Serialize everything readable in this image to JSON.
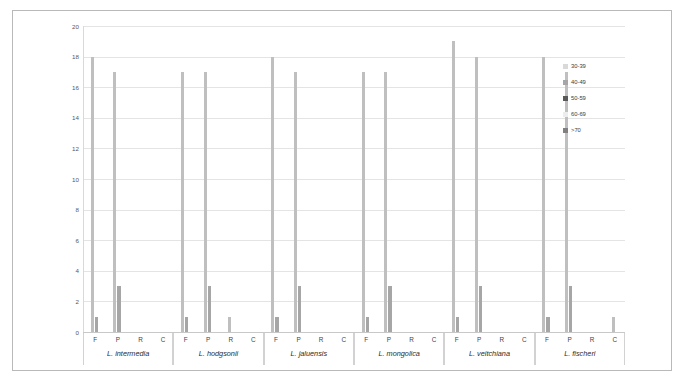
{
  "chart_data": {
    "type": "bar",
    "title": "",
    "xlabel": "",
    "ylabel": "",
    "ylim": [
      0,
      20
    ],
    "ytick_labels": [
      "0",
      "2",
      "4",
      "6",
      "8",
      "10",
      "12",
      "14",
      "16",
      "18",
      "20"
    ],
    "ytick_values": [
      0,
      2,
      4,
      6,
      8,
      10,
      12,
      14,
      16,
      18,
      20
    ],
    "grid": true,
    "legend_position": "right",
    "categories": [
      "F",
      "P",
      "R",
      "C"
    ],
    "groups": [
      {
        "species": "L. intermedia",
        "categories": [
          "F",
          "P",
          "R",
          "C"
        ],
        "bars": [
          {
            "category": "F",
            "series": "30-39",
            "value": 18
          },
          {
            "category": "F",
            "series": "40-49",
            "value": 1
          },
          {
            "category": "P",
            "series": "30-39",
            "value": 17
          },
          {
            "category": "P",
            "series": "40-49",
            "value": 3
          },
          {
            "category": "R",
            "series": "30-39",
            "value": 0
          },
          {
            "category": "C",
            "series": "30-39",
            "value": 0
          }
        ]
      },
      {
        "species": "L. hodgsonii",
        "categories": [
          "F",
          "P",
          "R",
          "C"
        ],
        "bars": [
          {
            "category": "F",
            "series": "30-39",
            "value": 17
          },
          {
            "category": "F",
            "series": "40-49",
            "value": 1
          },
          {
            "category": "P",
            "series": "30-39",
            "value": 17
          },
          {
            "category": "P",
            "series": "40-49",
            "value": 3
          },
          {
            "category": "R",
            "series": "30-39",
            "value": 1
          },
          {
            "category": "C",
            "series": "30-39",
            "value": 0
          }
        ]
      },
      {
        "species": "L. jaluensis",
        "categories": [
          "F",
          "P",
          "R",
          "C"
        ],
        "bars": [
          {
            "category": "F",
            "series": "30-39",
            "value": 18
          },
          {
            "category": "F",
            "series": "40-49",
            "value": 1
          },
          {
            "category": "P",
            "series": "30-39",
            "value": 17
          },
          {
            "category": "P",
            "series": "40-49",
            "value": 3
          },
          {
            "category": "R",
            "series": "30-39",
            "value": 0
          },
          {
            "category": "C",
            "series": "30-39",
            "value": 0
          }
        ]
      },
      {
        "species": "L. mongolica",
        "categories": [
          "F",
          "P",
          "R",
          "C"
        ],
        "bars": [
          {
            "category": "F",
            "series": "30-39",
            "value": 17
          },
          {
            "category": "F",
            "series": "40-49",
            "value": 1
          },
          {
            "category": "P",
            "series": "30-39",
            "value": 17
          },
          {
            "category": "P",
            "series": "40-49",
            "value": 3
          },
          {
            "category": "R",
            "series": "30-39",
            "value": 0
          },
          {
            "category": "C",
            "series": "30-39",
            "value": 0
          }
        ]
      },
      {
        "species": "L. veitchiana",
        "categories": [
          "F",
          "P",
          "R",
          "C"
        ],
        "bars": [
          {
            "category": "F",
            "series": "30-39",
            "value": 19
          },
          {
            "category": "F",
            "series": "40-49",
            "value": 1
          },
          {
            "category": "P",
            "series": "30-39",
            "value": 18
          },
          {
            "category": "P",
            "series": "40-49",
            "value": 3
          },
          {
            "category": "R",
            "series": "30-39",
            "value": 0
          },
          {
            "category": "C",
            "series": "30-39",
            "value": 0
          }
        ]
      },
      {
        "species": "L. fischeri",
        "categories": [
          "F",
          "P",
          "R",
          "C"
        ],
        "bars": [
          {
            "category": "F",
            "series": "30-39",
            "value": 18
          },
          {
            "category": "F",
            "series": "40-49",
            "value": 1
          },
          {
            "category": "P",
            "series": "30-39",
            "value": 17
          },
          {
            "category": "P",
            "series": "40-49",
            "value": 3
          },
          {
            "category": "R",
            "series": "30-39",
            "value": 0
          },
          {
            "category": "C",
            "series": "30-39",
            "value": 1
          }
        ]
      }
    ],
    "legend": [
      {
        "label": "30-39",
        "color": "#d9d9d9"
      },
      {
        "label": "40-49",
        "color": "#a6a6a6"
      },
      {
        "label": "50-59",
        "color": "#595959"
      },
      {
        "label": "60-69",
        "color": "#ededed"
      },
      {
        "label": ">70",
        "color": "#808080"
      }
    ]
  },
  "colors": {
    "bar_tall": "#bfbfbf",
    "bar_short": "#a6a6a6",
    "grid": "#e4e4e4",
    "axis": "#c8c8c8",
    "frame": "#b9b9b9",
    "text": "#3b3b3b"
  }
}
